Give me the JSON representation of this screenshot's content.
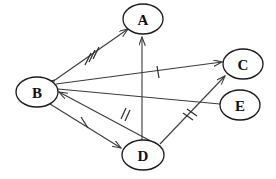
{
  "diagram": {
    "background_color": "#ffffff",
    "node_stroke_color": "#1a1a1a",
    "edge_color": "#3a3a3a",
    "label_color": "#111111",
    "width": 276,
    "height": 179,
    "nodes": [
      {
        "id": "A",
        "label": "A",
        "cx": 143,
        "cy": 19,
        "rx": 20,
        "ry": 15
      },
      {
        "id": "B",
        "label": "B",
        "cx": 37,
        "cy": 92,
        "rx": 21,
        "ry": 15
      },
      {
        "id": "C",
        "label": "C",
        "cx": 243,
        "cy": 64,
        "rx": 20,
        "ry": 15
      },
      {
        "id": "D",
        "label": "D",
        "cx": 143,
        "cy": 155,
        "rx": 21,
        "ry": 15
      },
      {
        "id": "E",
        "label": "E",
        "cx": 240,
        "cy": 105,
        "rx": 20,
        "ry": 15
      }
    ],
    "edges": [
      {
        "id": "edge-b-a",
        "from": "B",
        "to": "A",
        "arrow_start": true,
        "arrow_end": true,
        "ticks": 3
      },
      {
        "id": "edge-d-a",
        "from": "D",
        "to": "A",
        "arrow_start": false,
        "arrow_end": true,
        "ticks": 0
      },
      {
        "id": "edge-b-c",
        "from": "B",
        "to": "C",
        "arrow_start": false,
        "arrow_end": true,
        "ticks": 1
      },
      {
        "id": "edge-d-b",
        "from": "D",
        "to": "B",
        "arrow_start": false,
        "arrow_end": true,
        "ticks": 2
      },
      {
        "id": "edge-b-d",
        "from": "B",
        "to": "D",
        "arrow_start": false,
        "arrow_end": true,
        "ticks": 1
      },
      {
        "id": "edge-d-c",
        "from": "D",
        "to": "C",
        "arrow_start": false,
        "arrow_end": true,
        "ticks": 2
      },
      {
        "id": "edge-e-b",
        "from": "E",
        "to": "B",
        "arrow_start": false,
        "arrow_end": false,
        "ticks": 0
      }
    ]
  }
}
